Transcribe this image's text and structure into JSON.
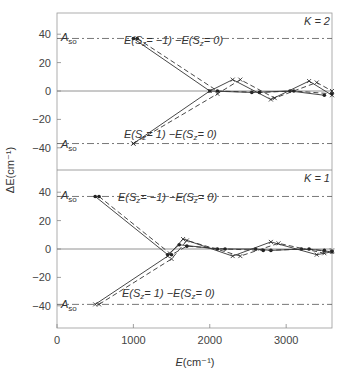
{
  "chart_data": [
    {
      "type": "line",
      "panel": "top",
      "title": "K=2",
      "xlabel": "E(cm^-1)",
      "ylabel": "ΔE(cm^-1)",
      "xlim": [
        0,
        3600
      ],
      "ylim": [
        -52,
        52
      ],
      "yticks": [
        -40,
        -20,
        0,
        20,
        40
      ],
      "reference_lines": [
        {
          "label": "A_so",
          "y": 37,
          "style": "dash-dot"
        },
        {
          "label": "A_so",
          "y": -37,
          "style": "dash-dot"
        }
      ],
      "annotations": [
        "E(S_z = -1)  -E(S_z = 0)",
        "E(S_z = 1)  -E(S_z = 0)"
      ],
      "series": [
        {
          "name": "E(Sz=-1)-E(Sz=0) solid",
          "marker": "dot",
          "x": [
            1000,
            2000,
            2550,
            3050,
            3500
          ],
          "y": [
            37,
            0,
            -1,
            0,
            -3
          ]
        },
        {
          "name": "E(Sz=-1)-E(Sz=0) dashed",
          "marker": "dot",
          "x": [
            1050,
            2100,
            2650,
            3100,
            3600
          ],
          "y": [
            37,
            0,
            -1,
            0,
            -2
          ]
        },
        {
          "name": "E(Sz=1)-E(Sz=0) solid",
          "marker": "cross",
          "x": [
            1000,
            2000,
            2300,
            2800,
            3300,
            3600
          ],
          "y": [
            -37,
            0,
            8,
            -6,
            7,
            -3
          ]
        },
        {
          "name": "E(Sz=1)-E(Sz=0) dashed",
          "marker": "cross",
          "x": [
            1000,
            2100,
            2400,
            2850,
            3400,
            3600
          ],
          "y": [
            -37,
            -2,
            8,
            -5,
            6,
            0
          ]
        }
      ]
    },
    {
      "type": "line",
      "panel": "bottom",
      "title": "K=1",
      "xlabel": "E(cm^-1)",
      "ylabel": "ΔE(cm^-1)",
      "xlim": [
        0,
        3600
      ],
      "ylim": [
        -52,
        52
      ],
      "xticks": [
        0,
        1000,
        2000,
        3000
      ],
      "yticks": [
        -40,
        -20,
        0,
        20,
        40
      ],
      "reference_lines": [
        {
          "label": "A_so",
          "y": 37,
          "style": "dash-dot"
        },
        {
          "label": "A_so",
          "y": -39,
          "style": "dash-dot"
        }
      ],
      "annotations": [
        "E(S_z = -1)  -E(S_z = 0)",
        "E(S_z = 1)  -E(S_z = 0)"
      ],
      "series": [
        {
          "name": "E(Sz=-1)-E(Sz=0) solid",
          "marker": "dot",
          "x": [
            500,
            1450,
            1600,
            2100,
            2600,
            2800,
            3200,
            3500
          ],
          "y": [
            37,
            -4,
            3,
            0,
            0,
            -1,
            0,
            -1
          ]
        },
        {
          "name": "E(Sz=-1)-E(Sz=0) dashed",
          "marker": "dot",
          "x": [
            550,
            1500,
            1700,
            2200,
            2700,
            3300,
            3600
          ],
          "y": [
            37,
            -4,
            2,
            0,
            -1,
            0,
            -2
          ]
        },
        {
          "name": "E(Sz=1)-E(Sz=0) solid",
          "marker": "cross",
          "x": [
            500,
            1450,
            1650,
            2300,
            2800,
            3400,
            3600
          ],
          "y": [
            -39,
            -5,
            7,
            -5,
            5,
            -4,
            -2
          ]
        },
        {
          "name": "E(Sz=1)-E(Sz=0) dashed",
          "marker": "cross",
          "x": [
            550,
            1500,
            1700,
            2400,
            2900,
            3500,
            3600
          ],
          "y": [
            -39,
            -7,
            6,
            -5,
            4,
            -3,
            -1
          ]
        }
      ]
    }
  ],
  "labels": {
    "top_title": "K=2",
    "bottom_title": "K=1",
    "ylabel": "ΔE(cm⁻¹)",
    "xlabel": "E(cm⁻¹)",
    "aso": "A",
    "aso_sub": "so",
    "ann_minus": "E(S",
    "ann_minus_b": "= −1)   −E(S",
    "ann_plus_b": "= 1)   −E(S",
    "ann_end": "= 0)",
    "z": "z"
  },
  "ticks": {
    "y": [
      "40",
      "20",
      "0",
      "−20",
      "−40"
    ],
    "x": [
      "0",
      "1000",
      "2000",
      "3000"
    ]
  }
}
